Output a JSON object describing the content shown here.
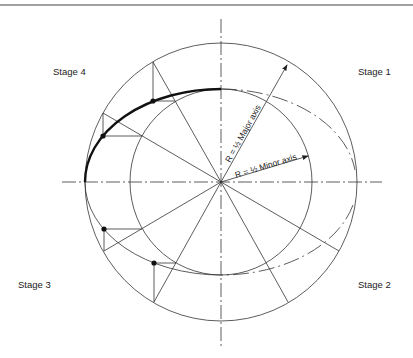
{
  "diagram": {
    "title": "",
    "stages": [
      {
        "id": "stage-1",
        "label": "Stage 1"
      },
      {
        "id": "stage-2",
        "label": "Stage 2"
      },
      {
        "id": "stage-3",
        "label": "Stage 3"
      },
      {
        "id": "stage-4",
        "label": "Stage 4"
      }
    ],
    "annotations": {
      "major": "R = ½ Major axis",
      "minor": "R = ½ Minor axis"
    },
    "geometry": {
      "center": [
        221,
        182
      ],
      "major_circle_radius": 136,
      "minor_circle_radius": 92,
      "radial_line_angles_deg": [
        30,
        60,
        120,
        150
      ],
      "construction_points": 4
    },
    "colors": {
      "line": "#333333",
      "bold_curve": "#111111",
      "background": "#ffffff"
    }
  }
}
